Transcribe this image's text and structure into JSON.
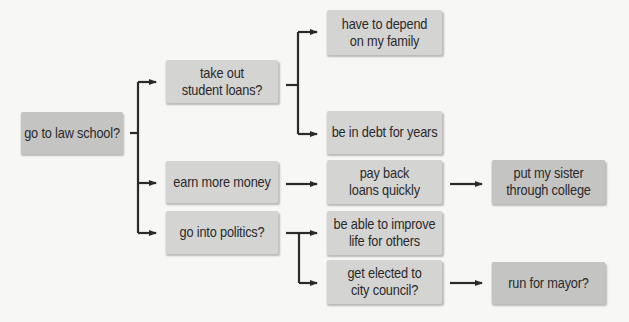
{
  "diagram": {
    "type": "decision-tree",
    "colors": {
      "background": "#f7f7f6",
      "node_light": "#d4d4d3",
      "node_dark": "#c4c4c3",
      "connector": "#2a2a2a",
      "text": "#2a2a2a"
    },
    "nodes": {
      "root": "go to law school?",
      "loans": "take out\nstudent loans?",
      "family": "have to depend\non my family",
      "debt": "be in debt for years",
      "money": "earn more money",
      "politics": "go into politics?",
      "payback": "pay back\nloans quickly",
      "sister": "put my sister\nthrough college",
      "improve": "be able to improve\nlife for others",
      "council": "get elected to\ncity council?",
      "mayor": "run for mayor?"
    },
    "edges": [
      [
        "root",
        "loans"
      ],
      [
        "root",
        "money"
      ],
      [
        "root",
        "politics"
      ],
      [
        "loans",
        "family"
      ],
      [
        "loans",
        "debt"
      ],
      [
        "money",
        "payback"
      ],
      [
        "payback",
        "sister"
      ],
      [
        "politics",
        "improve"
      ],
      [
        "politics",
        "council"
      ],
      [
        "council",
        "mayor"
      ]
    ]
  }
}
